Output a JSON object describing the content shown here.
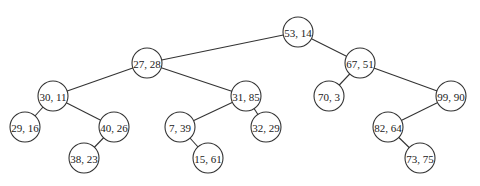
{
  "diagram": {
    "type": "k-d tree",
    "node_radius": 15,
    "nodes": [
      {
        "id": "n53_14",
        "label": "53, 14",
        "x": 298,
        "y": 32
      },
      {
        "id": "n27_28",
        "label": "27, 28",
        "x": 147,
        "y": 63
      },
      {
        "id": "n67_51",
        "label": "67, 51",
        "x": 360,
        "y": 63
      },
      {
        "id": "n30_11",
        "label": "30, 11",
        "x": 53,
        "y": 96
      },
      {
        "id": "n31_85",
        "label": "31, 85",
        "x": 246,
        "y": 96
      },
      {
        "id": "n70_3",
        "label": "70, 3",
        "x": 329,
        "y": 96
      },
      {
        "id": "n99_90",
        "label": "99, 90",
        "x": 451,
        "y": 96
      },
      {
        "id": "n29_16",
        "label": "29, 16",
        "x": 25,
        "y": 127
      },
      {
        "id": "n40_26",
        "label": "40, 26",
        "x": 114,
        "y": 127
      },
      {
        "id": "n7_39",
        "label": "7, 39",
        "x": 180,
        "y": 127
      },
      {
        "id": "n32_29",
        "label": "32, 29",
        "x": 266,
        "y": 127
      },
      {
        "id": "n82_64",
        "label": "82, 64",
        "x": 388,
        "y": 127
      },
      {
        "id": "n38_23",
        "label": "38, 23",
        "x": 84,
        "y": 158
      },
      {
        "id": "n15_61",
        "label": "15, 61",
        "x": 208,
        "y": 158
      },
      {
        "id": "n73_75",
        "label": "73, 75",
        "x": 420,
        "y": 158
      }
    ],
    "edges": [
      {
        "from": "n53_14",
        "to": "n27_28"
      },
      {
        "from": "n53_14",
        "to": "n67_51"
      },
      {
        "from": "n27_28",
        "to": "n30_11"
      },
      {
        "from": "n27_28",
        "to": "n31_85"
      },
      {
        "from": "n67_51",
        "to": "n70_3"
      },
      {
        "from": "n67_51",
        "to": "n99_90"
      },
      {
        "from": "n30_11",
        "to": "n29_16"
      },
      {
        "from": "n30_11",
        "to": "n40_26"
      },
      {
        "from": "n40_26",
        "to": "n38_23"
      },
      {
        "from": "n31_85",
        "to": "n7_39"
      },
      {
        "from": "n31_85",
        "to": "n32_29"
      },
      {
        "from": "n7_39",
        "to": "n15_61"
      },
      {
        "from": "n99_90",
        "to": "n82_64"
      },
      {
        "from": "n82_64",
        "to": "n73_75"
      }
    ]
  }
}
